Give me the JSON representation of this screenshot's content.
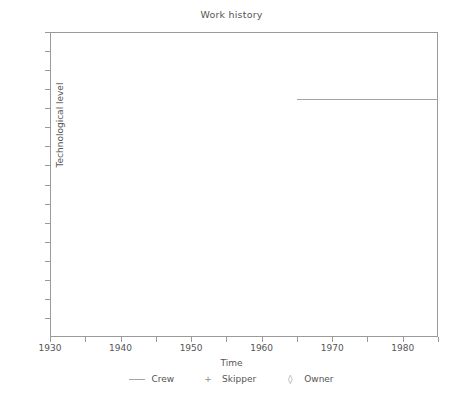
{
  "chart_data": {
    "type": "line",
    "title": "Work history",
    "xlabel": "Time",
    "ylabel": "Technological level",
    "xlim": [
      1930,
      1985
    ],
    "ylim": [
      0,
      16
    ],
    "grid": false,
    "legend_position": "bottom",
    "x_major_ticks": [
      1930,
      1940,
      1950,
      1960,
      1970,
      1980
    ],
    "x_major_tick_labels": [
      "1930",
      "1940",
      "1950",
      "1960",
      "1970",
      "1980"
    ],
    "x_minor_ticks": [
      1935,
      1945,
      1955,
      1965,
      1975,
      1985
    ],
    "y_ticks": [
      1,
      2,
      3,
      4,
      5,
      6,
      7,
      8,
      9,
      10,
      11,
      12,
      13,
      14,
      15,
      16
    ],
    "y_tick_labels": [],
    "series": [
      {
        "name": "Crew",
        "marker": "line",
        "x": [
          1965,
          1985
        ],
        "values": [
          12.5,
          12.5
        ]
      },
      {
        "name": "Skipper",
        "marker": "+",
        "x": [],
        "values": []
      },
      {
        "name": "Owner",
        "marker": "diamond",
        "x": [],
        "values": []
      }
    ],
    "legend": [
      {
        "label": "Crew",
        "marker": "line",
        "glyph": ""
      },
      {
        "label": "Skipper",
        "marker": "plus",
        "glyph": "+"
      },
      {
        "label": "Owner",
        "marker": "diamond",
        "glyph": "◊"
      }
    ],
    "colors": {
      "line": "#a5a5a5",
      "axis": "#9a9a9a",
      "text": "#555555",
      "background": "#ffffff"
    }
  }
}
